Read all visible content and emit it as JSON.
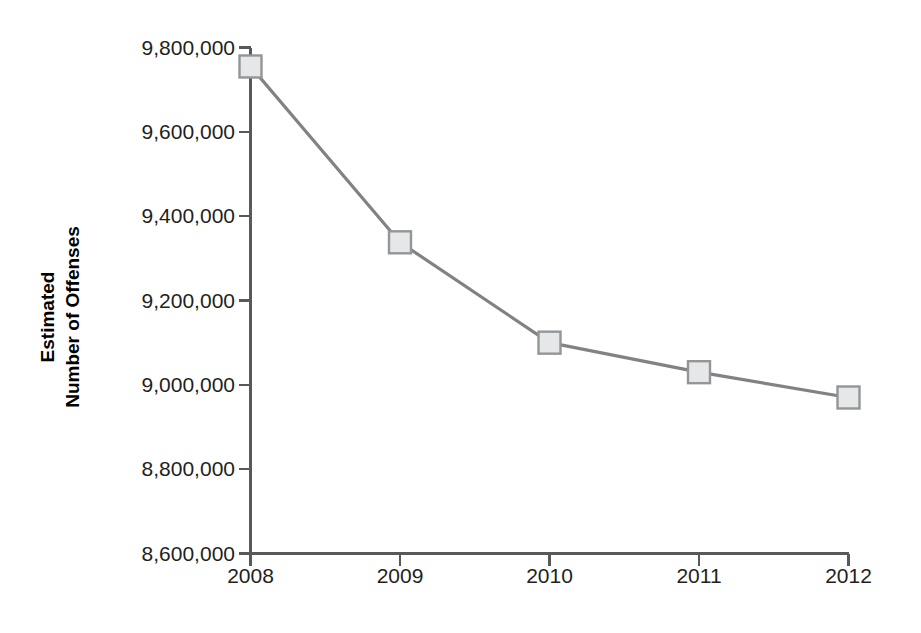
{
  "chart_data": {
    "type": "line",
    "title": "",
    "subtitle": "",
    "xlabel": "",
    "ylabel": "Estimated Number of Offenses",
    "ylabel_line1": "Estimated",
    "ylabel_line2": "Number of Offenses",
    "categories": [
      "2008",
      "2009",
      "2010",
      "2011",
      "2012"
    ],
    "x": [
      2008,
      2009,
      2010,
      2011,
      2012
    ],
    "values": [
      9755000,
      9338000,
      9100000,
      9030000,
      8970000
    ],
    "series": [
      {
        "name": "Estimated Number of Offenses",
        "values": [
          9755000,
          9338000,
          9100000,
          9030000,
          8970000
        ]
      }
    ],
    "ylim": [
      8600000,
      9800000
    ],
    "ytick_values": [
      9800000,
      9600000,
      9400000,
      9200000,
      9000000,
      8800000,
      8600000
    ],
    "ytick_labels": [
      "9,800,000",
      "9,600,000",
      "9,400,000",
      "9,200,000",
      "9,000,000",
      "8,800,000",
      "8,600,000"
    ],
    "xtick_labels": [
      "2008",
      "2009",
      "2010",
      "2011",
      "2012"
    ],
    "grid": false,
    "legend": false,
    "legend_position": "none",
    "marker": "square",
    "annotations": []
  },
  "style": {
    "line_color": "#808285",
    "marker_fill": "#e6e7e8",
    "marker_stroke": "#939598",
    "axis_color": "#58595b",
    "text_color": "#231f20",
    "background": "#ffffff"
  },
  "axes": {
    "y_axis_name": "y-axis",
    "x_axis_name": "x-axis"
  }
}
